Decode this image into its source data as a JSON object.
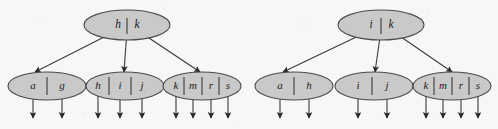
{
  "figure": {
    "title": "",
    "background_color": "#f7f7f7",
    "node_fill_color": "#c9c9c9",
    "node_stroke_color": "#4a4a4a",
    "edge_color": "#3a3a3a",
    "text_color": "#1a1a1a"
  },
  "trees": [
    {
      "id": "left-tree",
      "name": "left-btree",
      "root": {
        "name": "left-root-node",
        "keys": [
          "h",
          "k"
        ],
        "cx": 127,
        "cy": 25,
        "rx": 43,
        "ry": 15,
        "key_x": [
          118,
          137
        ],
        "key_y": 25,
        "divider_x": [
          127
        ]
      },
      "leaves": [
        {
          "name": "left-leaf-1",
          "keys": [
            "a",
            "g"
          ],
          "cx": 47,
          "cy": 86,
          "rx": 39,
          "ry": 14,
          "key_x": [
            33,
            62
          ],
          "key_y": 86,
          "pointer_x": [
            20,
            47,
            75
          ],
          "divider_x": [
            47
          ],
          "arrow_x": [
            33,
            62
          ]
        },
        {
          "name": "left-leaf-2",
          "keys": [
            "h",
            "i",
            "j"
          ],
          "cx": 125,
          "cy": 86,
          "rx": 39,
          "ry": 14,
          "key_x": [
            98,
            120,
            142
          ],
          "key_y": 86,
          "pointer_x": [
            88,
            109,
            131,
            153
          ],
          "divider_x": [
            109,
            131
          ],
          "arrow_x": [
            98,
            120,
            142
          ]
        },
        {
          "name": "left-leaf-3",
          "keys": [
            "k",
            "m",
            "r",
            "s"
          ],
          "cx": 202,
          "cy": 86,
          "rx": 39,
          "ry": 14,
          "key_x": [
            176,
            193,
            211,
            228
          ],
          "key_y": 86,
          "pointer_x": [
            167,
            184,
            202,
            219,
            237
          ],
          "divider_x": [
            184,
            202,
            219
          ],
          "arrow_x": [
            176,
            193,
            211,
            228
          ]
        }
      ],
      "edges": [
        {
          "name": "left-edge-root-to-leaf-1",
          "x1": 118,
          "y1": 30,
          "x2": 35,
          "y2": 72
        },
        {
          "name": "left-edge-root-to-leaf-2",
          "x1": 127,
          "y1": 30,
          "x2": 124,
          "y2": 72
        },
        {
          "name": "left-edge-root-to-leaf-3",
          "x1": 137,
          "y1": 30,
          "x2": 200,
          "y2": 72
        }
      ]
    },
    {
      "id": "right-tree",
      "name": "right-btree",
      "root": {
        "name": "right-root-node",
        "keys": [
          "i",
          "k"
        ],
        "cx": 381,
        "cy": 25,
        "rx": 43,
        "ry": 15,
        "key_x": [
          371,
          391
        ],
        "key_y": 25,
        "divider_x": [
          381
        ]
      },
      "leaves": [
        {
          "name": "right-leaf-1",
          "keys": [
            "a",
            "h"
          ],
          "cx": 294,
          "cy": 86,
          "rx": 39,
          "ry": 14,
          "key_x": [
            280,
            309
          ],
          "key_y": 86,
          "pointer_x": [
            267,
            294,
            322
          ],
          "divider_x": [
            294
          ],
          "arrow_x": [
            280,
            309
          ]
        },
        {
          "name": "right-leaf-2",
          "keys": [
            "i",
            "j"
          ],
          "cx": 374,
          "cy": 86,
          "rx": 39,
          "ry": 14,
          "key_x": [
            358,
            387
          ],
          "key_y": 86,
          "pointer_x": [
            345,
            372,
            400
          ],
          "divider_x": [
            372
          ],
          "arrow_x": [
            358,
            387
          ]
        },
        {
          "name": "right-leaf-3",
          "keys": [
            "k",
            "m",
            "r",
            "s"
          ],
          "cx": 452,
          "cy": 86,
          "rx": 39,
          "ry": 14,
          "key_x": [
            426,
            443,
            461,
            478
          ],
          "key_y": 86,
          "pointer_x": [
            417,
            434,
            452,
            469,
            487
          ],
          "divider_x": [
            434,
            452,
            469
          ],
          "arrow_x": [
            426,
            443,
            461,
            478
          ]
        }
      ],
      "edges": [
        {
          "name": "right-edge-root-to-leaf-1",
          "x1": 371,
          "y1": 30,
          "x2": 283,
          "y2": 72
        },
        {
          "name": "right-edge-root-to-leaf-2",
          "x1": 381,
          "y1": 30,
          "x2": 375,
          "y2": 72
        },
        {
          "name": "right-edge-root-to-leaf-3",
          "x1": 391,
          "y1": 30,
          "x2": 452,
          "y2": 72
        }
      ]
    }
  ],
  "leaf_pointer_arrow_y_end": 118
}
